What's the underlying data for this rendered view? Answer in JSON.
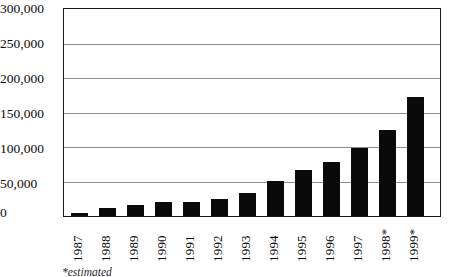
{
  "chart_data": {
    "type": "bar",
    "title": "",
    "xlabel": "",
    "ylabel": "",
    "categories": [
      "1987",
      "1988",
      "1989",
      "1990",
      "1991",
      "1992",
      "1993",
      "1994",
      "1995",
      "1996",
      "1997",
      "1998*",
      "1999*"
    ],
    "values": [
      5000,
      11000,
      16000,
      20000,
      20000,
      25000,
      33000,
      51000,
      67000,
      78000,
      99000,
      124000,
      173000
    ],
    "ylim": [
      0,
      300000
    ],
    "ytick_values": [
      0,
      50000,
      100000,
      150000,
      200000,
      250000,
      300000
    ],
    "ytick_labels": [
      "0",
      "50,000",
      "100,000",
      "150,000",
      "200,000",
      "250,000",
      "300,000"
    ],
    "grid": true,
    "legend": "none",
    "bar_color": "#0a0a0a",
    "gridline_color": "#8d8d8d",
    "frame_color": "#1a1a1a",
    "footnote": "*estimated"
  }
}
